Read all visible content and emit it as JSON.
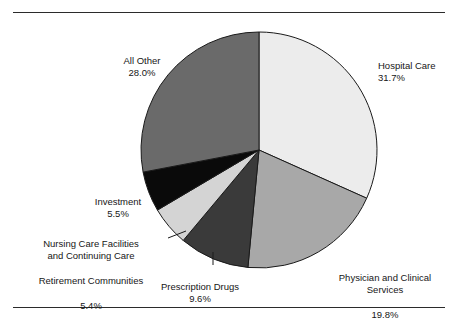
{
  "figure": {
    "frame_color": "#2b2b2b",
    "background": "#ffffff"
  },
  "chart_data": {
    "type": "pie",
    "title": "",
    "subtitle": "",
    "xlabel": "",
    "ylabel": "",
    "legend_position": "callout-labels",
    "grid": false,
    "units": "percent",
    "start_angle_deg": 0,
    "direction": "clockwise",
    "categories": [
      "Hospital Care",
      "Physician and Clinical Services",
      "Prescription Drugs",
      "Nursing Care Facilities and Continuing Care Retirement Communities",
      "Investment",
      "All Other"
    ],
    "values": [
      31.7,
      19.8,
      9.6,
      5.4,
      5.5,
      28.0
    ],
    "slices": [
      {
        "name": "hospital-care",
        "label": "Hospital Care",
        "value": 31.7,
        "value_text": "31.7%",
        "color": "#ececec",
        "start_deg": 0.0,
        "end_deg": 114.12
      },
      {
        "name": "physician-and-clinical-services",
        "label": "Physician and Clinical\nServices",
        "value": 19.8,
        "value_text": "19.8%",
        "color": "#a8a8a8",
        "start_deg": 114.12,
        "end_deg": 185.4
      },
      {
        "name": "prescription-drugs",
        "label": "Prescription Drugs",
        "value": 9.6,
        "value_text": "9.6%",
        "color": "#3a3a3a",
        "start_deg": 185.4,
        "end_deg": 219.96
      },
      {
        "name": "nursing-care-facilities",
        "label": "Nursing Care Facilities\nand Continuing Care\nRetirement Communities",
        "value": 5.4,
        "value_text": "5.4%",
        "color": "#d4d4d4",
        "start_deg": 219.96,
        "end_deg": 239.4
      },
      {
        "name": "investment",
        "label": "Investment",
        "value": 5.5,
        "value_text": "5.5%",
        "color": "#0a0a0a",
        "start_deg": 239.4,
        "end_deg": 259.2
      },
      {
        "name": "all-other",
        "label": "All Other",
        "value": 28.0,
        "value_text": "28.0%",
        "color": "#6a6a6a",
        "start_deg": 259.2,
        "end_deg": 360.0
      }
    ]
  },
  "labels": {
    "hospital": {
      "name": "Hospital Care",
      "pct": "31.7%"
    },
    "physician": {
      "line1": "Physician and Clinical",
      "line2": "Services",
      "pct": "19.8%"
    },
    "prescription": {
      "name": "Prescription Drugs",
      "pct": "9.6%"
    },
    "nursing": {
      "line1": "Nursing Care Facilities",
      "line2": "and Continuing Care",
      "line3": "Retirement Communities",
      "pct": "5.4%"
    },
    "investment": {
      "name": "Investment",
      "pct": "5.5%"
    },
    "allother": {
      "name": "All Other",
      "pct": "28.0%"
    }
  }
}
